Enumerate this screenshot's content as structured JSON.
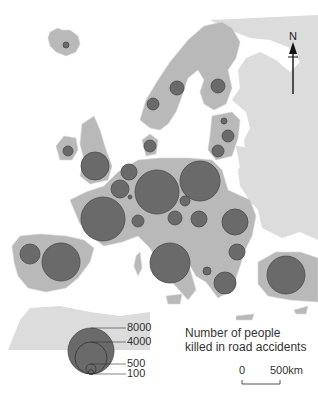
{
  "map": {
    "title_line1": "Number of people",
    "title_line2": "killed in road accidents",
    "north_label": "N",
    "scale": {
      "start": "0",
      "end": "500",
      "unit": "km"
    },
    "legend": {
      "values": [
        "8000",
        "4000",
        "500",
        "100"
      ]
    },
    "colors": {
      "water": "#ffffff",
      "land_eu": "#b9b9b9",
      "land_other": "#dcdcdc",
      "circle_fill": "#6a6a6a",
      "circle_stroke": "#4a4a4a"
    },
    "circles": [
      {
        "region": "Iceland",
        "cx": 66,
        "cy": 45,
        "r": 3
      },
      {
        "region": "Norway",
        "cx": 153,
        "cy": 104,
        "r": 6
      },
      {
        "region": "Sweden",
        "cx": 177,
        "cy": 88,
        "r": 7
      },
      {
        "region": "Finland",
        "cx": 218,
        "cy": 86,
        "r": 7
      },
      {
        "region": "Estonia",
        "cx": 224,
        "cy": 121,
        "r": 3
      },
      {
        "region": "Latvia",
        "cx": 228,
        "cy": 136,
        "r": 6
      },
      {
        "region": "Lithuania",
        "cx": 218,
        "cy": 151,
        "r": 6
      },
      {
        "region": "Denmark",
        "cx": 150,
        "cy": 146,
        "r": 6
      },
      {
        "region": "Ireland",
        "cx": 68,
        "cy": 151,
        "r": 5
      },
      {
        "region": "United Kingdom",
        "cx": 95,
        "cy": 166,
        "r": 14
      },
      {
        "region": "Netherlands",
        "cx": 129,
        "cy": 172,
        "r": 8
      },
      {
        "region": "Belgium",
        "cx": 120,
        "cy": 189,
        "r": 9
      },
      {
        "region": "Luxembourg",
        "cx": 130,
        "cy": 197,
        "r": 2
      },
      {
        "region": "Germany",
        "cx": 157,
        "cy": 192,
        "r": 22
      },
      {
        "region": "Poland",
        "cx": 200,
        "cy": 181,
        "r": 20
      },
      {
        "region": "Czech Republic",
        "cx": 185,
        "cy": 201,
        "r": 5
      },
      {
        "region": "France",
        "cx": 103,
        "cy": 219,
        "r": 22
      },
      {
        "region": "Switzerland",
        "cx": 138,
        "cy": 221,
        "r": 6
      },
      {
        "region": "Austria",
        "cx": 175,
        "cy": 218,
        "r": 7
      },
      {
        "region": "Hungary",
        "cx": 199,
        "cy": 219,
        "r": 8
      },
      {
        "region": "Romania",
        "cx": 235,
        "cy": 222,
        "r": 13
      },
      {
        "region": "Portugal",
        "cx": 30,
        "cy": 254,
        "r": 10
      },
      {
        "region": "Spain",
        "cx": 61,
        "cy": 262,
        "r": 19
      },
      {
        "region": "Italy",
        "cx": 170,
        "cy": 263,
        "r": 20
      },
      {
        "region": "Bulgaria",
        "cx": 237,
        "cy": 252,
        "r": 8
      },
      {
        "region": "Macedonia",
        "cx": 207,
        "cy": 271,
        "r": 4
      },
      {
        "region": "Greece",
        "cx": 225,
        "cy": 283,
        "r": 11
      },
      {
        "region": "Turkey",
        "cx": 286,
        "cy": 275,
        "r": 19
      }
    ]
  }
}
